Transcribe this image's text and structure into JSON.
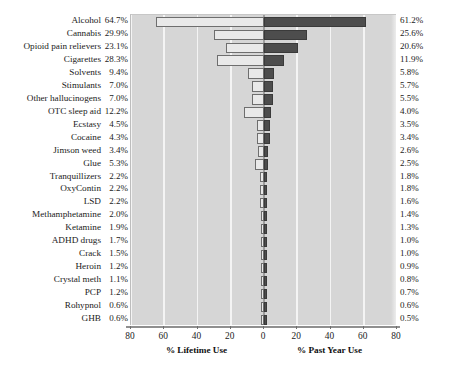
{
  "chart_data": {
    "type": "bar",
    "subtype": "diverging-tornado",
    "title": "",
    "grid": true,
    "legend": false,
    "categories": [
      "Alcohol",
      "Cannabis",
      "Opioid pain relievers",
      "Cigarettes",
      "Solvents",
      "Stimulants",
      "Other hallucinogens",
      "OTC sleep aid",
      "Ecstasy",
      "Cocaine",
      "Jimson weed",
      "Glue",
      "Tranquillizers",
      "OxyContin",
      "LSD",
      "Methamphetamine",
      "Ketamine",
      "ADHD drugs",
      "Crack",
      "Heroin",
      "Crystal meth",
      "PCP",
      "Rohypnol",
      "GHB"
    ],
    "series": [
      {
        "name": "% Lifetime Use",
        "side": "left",
        "color": "#e9e9e9",
        "values": [
          64.7,
          29.9,
          23.1,
          28.3,
          9.4,
          7.0,
          7.0,
          12.2,
          4.5,
          4.3,
          3.4,
          5.3,
          2.2,
          2.2,
          2.2,
          2.0,
          1.9,
          1.7,
          1.5,
          1.2,
          1.1,
          1.2,
          0.6,
          0.6
        ],
        "labels": [
          "64.7%",
          "29.9%",
          "23.1%",
          "28.3%",
          "9.4%",
          "7.0%",
          "7.0%",
          "12.2%",
          "4.5%",
          "4.3%",
          "3.4%",
          "5.3%",
          "2.2%",
          "2.2%",
          "2.2%",
          "2.0%",
          "1.9%",
          "1.7%",
          "1.5%",
          "1.2%",
          "1.1%",
          "1.2%",
          "0.6%",
          "0.6%"
        ]
      },
      {
        "name": "% Past Year Use",
        "side": "right",
        "color": "#4d4d4d",
        "values": [
          61.2,
          25.6,
          20.6,
          11.9,
          5.8,
          5.7,
          5.5,
          4.0,
          3.5,
          3.4,
          2.6,
          2.5,
          1.8,
          1.8,
          1.6,
          1.4,
          1.3,
          1.0,
          1.0,
          0.9,
          0.8,
          0.7,
          0.6,
          0.5
        ],
        "labels": [
          "61.2%",
          "25.6%",
          "20.6%",
          "11.9%",
          "5.8%",
          "5.7%",
          "5.5%",
          "4.0%",
          "3.5%",
          "3.4%",
          "2.6%",
          "2.5%",
          "1.8%",
          "1.8%",
          "1.6%",
          "1.4%",
          "1.3%",
          "1.0%",
          "1.0%",
          "0.9%",
          "0.8%",
          "0.7%",
          "0.6%",
          "0.5%"
        ]
      }
    ],
    "axis": {
      "left_title": "% Lifetime Use",
      "right_title": "% Past Year Use",
      "left_ticks": [
        80,
        60,
        40,
        20,
        0
      ],
      "right_ticks": [
        20,
        40,
        60,
        80
      ],
      "tick_labels": [
        "80",
        "60",
        "40",
        "20",
        "0",
        "20",
        "40",
        "60",
        "80"
      ],
      "max": 80,
      "xlim_left": [
        80,
        0
      ],
      "xlim_right": [
        0,
        80
      ]
    },
    "colors": {
      "plot_background": "#d6d6d6",
      "gridline": "#f4f4f4",
      "zero_axis": "#9e9e9e",
      "bar_left": "#e9e9e9",
      "bar_right": "#4d4d4d",
      "bar_outline": "#6e6e6e",
      "text": "#1b1b1b",
      "page_background": "#ffffff"
    }
  }
}
